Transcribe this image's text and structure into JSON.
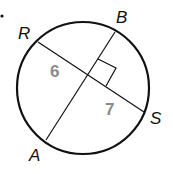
{
  "diagram": {
    "type": "circle-chords",
    "colors": {
      "stroke": "#111111",
      "length_label": "#8a8a8a",
      "background": "#ffffff"
    },
    "circle": {
      "cx": 83,
      "cy": 88,
      "r": 66
    },
    "points": {
      "R": {
        "label": "R",
        "x": 38,
        "y": 42
      },
      "S": {
        "label": "S",
        "x": 144,
        "y": 112
      },
      "B": {
        "label": "B",
        "x": 115,
        "y": 32
      },
      "A": {
        "label": "A",
        "x": 46,
        "y": 140
      }
    },
    "chords": [
      {
        "name": "RS",
        "from": "R",
        "to": "S"
      },
      {
        "name": "AB",
        "from": "A",
        "to": "B"
      }
    ],
    "intersection": {
      "x": 87,
      "y": 74
    },
    "right_angle_marker": true,
    "segment_labels": [
      {
        "value": "6",
        "segment": "R-intersection"
      },
      {
        "value": "7",
        "segment": "intersection-S"
      }
    ],
    "labels": {
      "R": "R",
      "B": "B",
      "S": "S",
      "A": "A",
      "len_left": "6",
      "len_right": "7"
    }
  }
}
